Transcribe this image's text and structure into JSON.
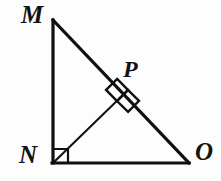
{
  "figure": {
    "kind": "geometry-diagram",
    "background_color": "#fdfdfd",
    "stroke_color": "#101010",
    "labels": {
      "M": "M",
      "N": "N",
      "O": "O",
      "P": "P"
    },
    "points": {
      "M": {
        "x": 53,
        "y": 20
      },
      "N": {
        "x": 53,
        "y": 163
      },
      "O": {
        "x": 188,
        "y": 163
      },
      "P": {
        "x": 122,
        "y": 96
      }
    },
    "segments": [
      {
        "name": "MN",
        "from": "M",
        "to": "N",
        "width": 3.2
      },
      {
        "name": "NO",
        "from": "N",
        "to": "O",
        "width": 3.2
      },
      {
        "name": "MO",
        "from": "M",
        "to": "O",
        "width": 3.2
      },
      {
        "name": "NP",
        "from": "N",
        "to": "P",
        "width": 2.0
      }
    ],
    "right_angle_marks": [
      {
        "name": "right-angle-at-N",
        "at": "N",
        "style": "square",
        "size": 14
      },
      {
        "name": "right-angle-at-P",
        "at": "P",
        "style": "rotated-square",
        "size": 16
      }
    ]
  }
}
